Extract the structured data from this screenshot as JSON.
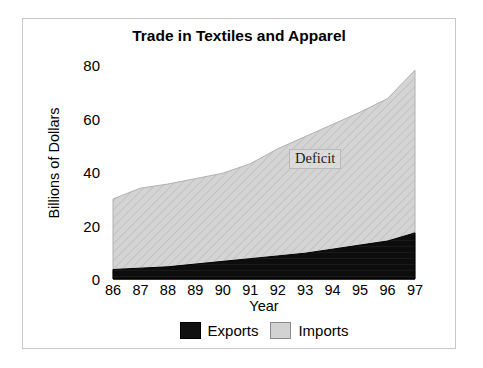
{
  "chart_data": {
    "type": "area",
    "title": "Trade in Textiles and Apparel",
    "xlabel": "Year",
    "ylabel": "Billions of Dollars",
    "categories": [
      "86",
      "87",
      "88",
      "89",
      "90",
      "91",
      "92",
      "93",
      "94",
      "95",
      "96",
      "97"
    ],
    "series": [
      {
        "name": "Exports",
        "color": "#111111",
        "values": [
          3.5,
          4.0,
          4.5,
          5.5,
          6.5,
          7.5,
          8.5,
          9.5,
          11.0,
          12.5,
          14.0,
          17.0
        ]
      },
      {
        "name": "Imports",
        "color": "#d2d2d2",
        "values": [
          29.5,
          33.5,
          35.0,
          37.0,
          39.0,
          42.5,
          48.0,
          52.5,
          57.0,
          61.5,
          66.5,
          77.0
        ]
      }
    ],
    "stacked": false,
    "ylim": [
      0,
      80
    ],
    "yticks": [
      0,
      20,
      40,
      60,
      80
    ],
    "ytick_labels": [
      "0",
      "20",
      "40",
      "60",
      "80"
    ],
    "grid": false,
    "legend_position": "bottom",
    "annotations": [
      {
        "text": "Deficit",
        "x": "92",
        "y": 45
      }
    ]
  },
  "legend": {
    "items": [
      {
        "label": "Exports",
        "swatch": "black-solid-swatch"
      },
      {
        "label": "Imports",
        "swatch": "gray-hatched-swatch"
      }
    ]
  }
}
